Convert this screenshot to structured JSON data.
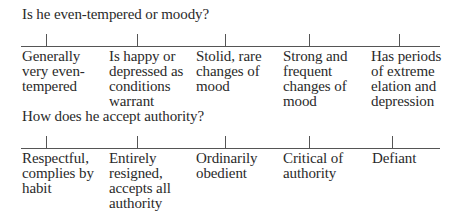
{
  "items": [
    {
      "question": "Is he even-tempered or moody?",
      "options": [
        "Generally\nvery even-\ntempered",
        "Is happy or\ndepressed as\nconditions\nwarrant",
        "Stolid, rare\nchanges of\nmood",
        "Strong and\nfrequent\nchanges of\nmood",
        "Has periods\nof extreme\nelation and\ndepression"
      ]
    },
    {
      "question": "How does he accept authority?",
      "options": [
        "Respectful,\ncomplies by\nhabit",
        "Entirely\nresigned,\naccepts all\nauthority",
        "Ordinarily\nobedient",
        "Critical of\nauthority",
        "Defiant"
      ]
    }
  ]
}
